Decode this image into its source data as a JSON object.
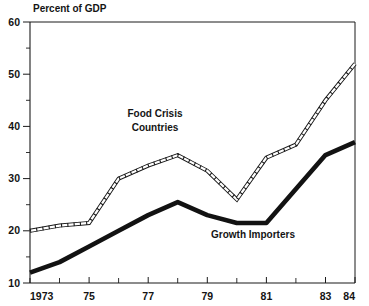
{
  "chart_data": {
    "type": "line",
    "title": "",
    "ylabel": "Percent of GDP",
    "xlabel": "",
    "ylim": [
      10,
      60
    ],
    "xlim": [
      1973,
      1984
    ],
    "grid": false,
    "legend_position": "inline-annotations",
    "x": [
      1973,
      1974,
      1975,
      1976,
      1977,
      1978,
      1979,
      1980,
      1981,
      1982,
      1983,
      1984
    ],
    "x_tick_labels": [
      "1973",
      "",
      "75",
      "",
      "77",
      "",
      "79",
      "",
      "81",
      "",
      "83",
      "84"
    ],
    "y_ticks_major": [
      10,
      20,
      30,
      40,
      50,
      60
    ],
    "y_ticks_minor": [
      15,
      25,
      35,
      45,
      55
    ],
    "y_tick_labels": [
      "10",
      "20",
      "30",
      "40",
      "50",
      "60"
    ],
    "series": [
      {
        "name": "Food Crisis Countries",
        "style": "double-outline",
        "values": [
          20.0,
          21.0,
          21.5,
          30.0,
          32.5,
          34.5,
          31.5,
          26.0,
          34.0,
          36.5,
          45.0,
          52.0
        ]
      },
      {
        "name": "Growth Importers",
        "style": "solid-thick",
        "values": [
          12.0,
          14.0,
          17.0,
          20.0,
          23.0,
          25.5,
          23.0,
          21.5,
          21.5,
          28.0,
          34.5,
          37.0
        ]
      }
    ],
    "annotations": [
      {
        "text_line1": "Food Crisis",
        "text_line2": "Countries",
        "x": 1977.0,
        "y": 41.5
      },
      {
        "text_line1": "Growth Importers",
        "text_line2": "",
        "x": 1981.0,
        "y": 18.0
      }
    ]
  },
  "axis": {
    "y_label_text": "Percent of GDP",
    "y_60": "60",
    "y_50": "50",
    "y_40": "40",
    "y_30": "30",
    "y_20": "20",
    "y_10": "10",
    "x_1973": "1973",
    "x_75": "75",
    "x_77": "77",
    "x_79": "79",
    "x_81": "81",
    "x_83": "83",
    "x_84": "84"
  },
  "annotations": {
    "food_crisis_line1": "Food Crisis",
    "food_crisis_line2": "Countries",
    "growth_importers": "Growth Importers"
  },
  "colors": {
    "ink": "#1a1a1a",
    "paper": "#ffffff"
  }
}
